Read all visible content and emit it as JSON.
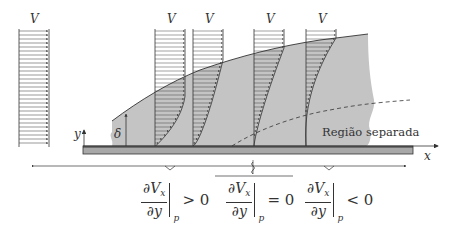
{
  "diagram": {
    "labels": {
      "free_stream_velocity": "V",
      "profile_velocity_1": "V",
      "profile_velocity_2": "V",
      "profile_velocity_3": "V",
      "profile_velocity_4": "V",
      "boundary_layer_thickness": "δ",
      "y_axis": "y",
      "x_axis": "x",
      "separated_region": "Região separada"
    },
    "conditions": [
      {
        "numerator": "∂V",
        "numerator_sub": "x",
        "denominator": "∂y",
        "eval_sub": "p",
        "relation": "> 0"
      },
      {
        "numerator": "∂V",
        "numerator_sub": "x",
        "denominator": "∂y",
        "eval_sub": "p",
        "relation": "= 0"
      },
      {
        "numerator": "∂V",
        "numerator_sub": "x",
        "denominator": "∂y",
        "eval_sub": "p",
        "relation": "< 0"
      }
    ],
    "colors": {
      "boundary_layer_fill": "#c4c4c4",
      "plate": "#a8a8a8",
      "lines": "#333333",
      "background": "#ffffff"
    }
  }
}
